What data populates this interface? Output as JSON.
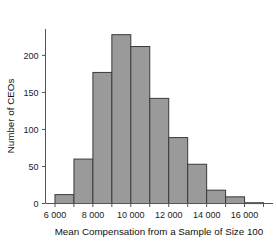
{
  "chart_data": {
    "type": "bar",
    "title": "",
    "subtitle": "",
    "xlabel": "Mean Compensation from a Sample of Size 100",
    "ylabel": "Number of CEOs",
    "bin_width": 1000,
    "bin_edges": [
      6000,
      7000,
      8000,
      9000,
      10000,
      11000,
      12000,
      13000,
      14000,
      15000,
      16000,
      17000
    ],
    "categories": [
      "6000-7000",
      "7000-8000",
      "8000-9000",
      "9000-10000",
      "10000-11000",
      "11000-12000",
      "12000-13000",
      "13000-14000",
      "14000-15000",
      "15000-16000",
      "16000-17000"
    ],
    "values": [
      12,
      60,
      177,
      228,
      212,
      142,
      89,
      53,
      18,
      9,
      1
    ],
    "xlim": [
      5500,
      17500
    ],
    "ylim": [
      0,
      235
    ],
    "xticks": [
      6000,
      8000,
      10000,
      12000,
      14000,
      16000
    ],
    "xticklabels": [
      "6 000",
      "8 000",
      "10 000",
      "12 000",
      "14 000",
      "16 000"
    ],
    "yticks": [
      0,
      50,
      100,
      150,
      200
    ],
    "yticklabels": [
      "0",
      "50",
      "100",
      "150",
      "200"
    ],
    "grid": false,
    "legend": false,
    "bar_fill": "#9a9a9a",
    "bar_stroke": "#3a3a3a",
    "axis_color": "#555555"
  }
}
